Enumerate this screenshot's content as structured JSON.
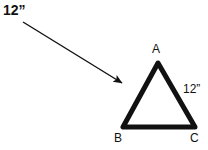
{
  "figure": {
    "type": "geometry-diagram",
    "background_color": "#ffffff",
    "ink_color": "#111111",
    "annotation": {
      "lead_label": "12”",
      "arrow": {
        "name": "pointer-arrow",
        "from": [
          23,
          22
        ],
        "to": [
          126,
          86
        ],
        "stroke_width": 1.4,
        "head_length": 9,
        "head_width": 7
      }
    },
    "triangle": {
      "name": "triangle-abc",
      "stroke_width": 5,
      "stroke_color": "#111111",
      "fill": "none",
      "vertices": [
        {
          "id": "A",
          "label": "A",
          "x": 158,
          "y": 63
        },
        {
          "id": "B",
          "label": "B",
          "x": 123,
          "y": 127
        },
        {
          "id": "C",
          "label": "C",
          "x": 195,
          "y": 127
        }
      ],
      "side_labels": [
        {
          "id": "AC",
          "label": "12”",
          "x": 183,
          "y": 83
        }
      ]
    }
  }
}
